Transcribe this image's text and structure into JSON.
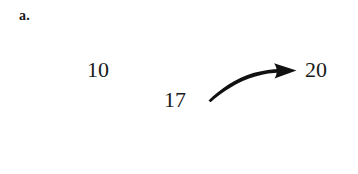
{
  "figure": {
    "part_label": "a.",
    "background_color": "#ffffff",
    "ink_color": "#1a1a1a",
    "numbers": {
      "top_left": "10",
      "bottom_middle": "17",
      "right": "20"
    },
    "arrow": {
      "name": "curved-arrow",
      "description": "curved arrow pointing right",
      "color": "#111111",
      "start": "17",
      "end": "20"
    }
  }
}
